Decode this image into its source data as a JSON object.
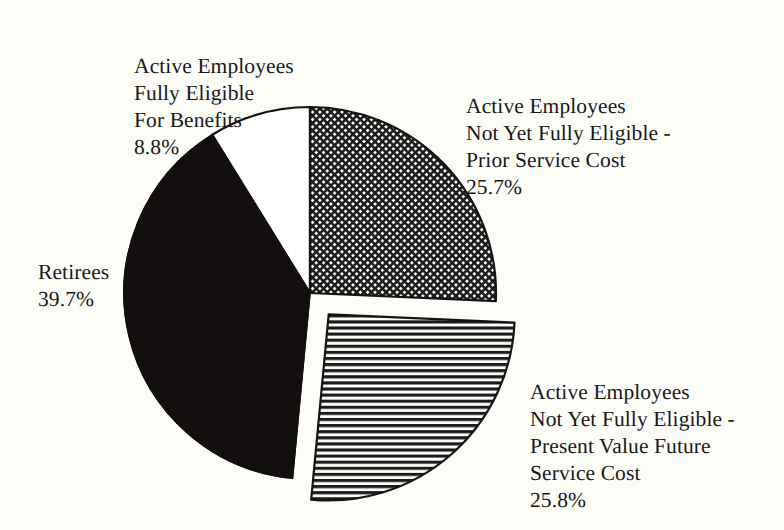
{
  "chart_data": {
    "type": "pie",
    "title": "",
    "categories": [
      "Active Employees Fully Eligible For Benefits",
      "Active Employees Not Yet Fully Eligible - Prior Service Cost",
      "Active Employees Not Yet Fully Eligible - Present Value Future Service Cost",
      "Retirees"
    ],
    "values": [
      8.8,
      25.7,
      25.8,
      39.7
    ],
    "value_unit": "%",
    "legend": "none",
    "labels_position": "outside-callout",
    "slices": [
      {
        "name": "active-employees-fully-eligible",
        "label_lines": [
          "Active Employees",
          "Fully Eligible",
          "For Benefits"
        ],
        "percent_text": "8.8%",
        "value": 8.8,
        "fill_style": "solid-white",
        "fill_color": "#ffffff",
        "start_angle_deg": 328.3,
        "end_angle_deg": 360.0,
        "exploded": false
      },
      {
        "name": "active-employees-prior-service-cost",
        "label_lines": [
          "Active Employees",
          "Not Yet Fully Eligible -",
          "Prior Service Cost"
        ],
        "percent_text": "25.7%",
        "value": 25.7,
        "fill_style": "crosshatch",
        "fill_color": "#1b1b1b",
        "start_angle_deg": 0.0,
        "end_angle_deg": 92.5,
        "exploded": false
      },
      {
        "name": "active-employees-present-value-future-service-cost",
        "label_lines": [
          "Active Employees",
          "Not Yet Fully Eligible -",
          "Present Value Future",
          "Service Cost"
        ],
        "percent_text": "25.8%",
        "value": 25.8,
        "fill_style": "horizontal-lines",
        "fill_color": "#1b1b1b",
        "start_angle_deg": 92.5,
        "end_angle_deg": 185.4,
        "exploded": true
      },
      {
        "name": "retirees",
        "label_lines": [
          "Retirees"
        ],
        "percent_text": "39.7%",
        "value": 39.7,
        "fill_style": "solid-black",
        "fill_color": "#120f0e",
        "start_angle_deg": 185.4,
        "end_angle_deg": 328.3,
        "exploded": false
      }
    ],
    "geometry": {
      "center_x": 310,
      "center_y": 293,
      "radius": 186,
      "explode_offset_x": 27,
      "explode_offset_y": 9
    },
    "colors": {
      "background": "#fdfdf8",
      "outline": "#141414",
      "text": "#17171a"
    }
  },
  "labels": {
    "fully_eligible": "Active Employees\nFully Eligible\nFor Benefits",
    "fully_eligible_pct": "8.8%",
    "prior_service": "Active Employees\nNot Yet Fully Eligible -\nPrior Service Cost",
    "prior_service_pct": "25.7%",
    "present_value": "Active Employees\nNot Yet Fully Eligible -\nPresent Value Future\nService Cost",
    "present_value_pct": "25.8%",
    "retirees": "Retirees",
    "retirees_pct": "39.7%"
  }
}
